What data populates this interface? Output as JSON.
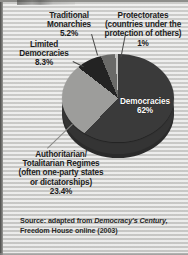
{
  "figure": {
    "background_color": "#d8d8d6",
    "source_prefix": "Source: adapted from ",
    "source_italic": "Democracy's Century,",
    "source_suffix": "Freedom House online (2003)"
  },
  "chart_data": {
    "type": "pie",
    "title": "",
    "xlabel": "",
    "ylabel": "",
    "legend_position": "callout-labels",
    "grid": false,
    "three_d": true,
    "categories": [
      "Democracies",
      "Authoritarian/Totalitarian Regimes",
      "Limited Democracies",
      "Traditional Monarchies",
      "Protectorates"
    ],
    "values": [
      62,
      23.4,
      8.3,
      5.2,
      1
    ],
    "value_labels": [
      "62%",
      "23.4%",
      "8.3%",
      "5.2%",
      "1%"
    ],
    "colors": [
      "#3a3a3a",
      "#9d9d9b",
      "#232323",
      "#6a6a68",
      "#c3c3c1"
    ],
    "slices": [
      {
        "name": "Democracies",
        "value": 62,
        "value_label": "62%",
        "color": "#3a3a3a",
        "label_placement": "inside",
        "label_line1": "Democracies",
        "label_line2": "62%"
      },
      {
        "name": "Authoritarian/Totalitarian Regimes",
        "value": 23.4,
        "value_label": "23.4%",
        "color": "#9d9d9b",
        "label_placement": "callout-bottom-left",
        "label_line1": "Authoritarian/",
        "label_line2": "Totalitarian Regimes",
        "label_line3": "(often one-party states",
        "label_line4": "or dictatorships)",
        "label_line5": "23.4%"
      },
      {
        "name": "Limited Democracies",
        "value": 8.3,
        "value_label": "8.3%",
        "color": "#232323",
        "label_placement": "callout-left",
        "label_line1": "Limited",
        "label_line2": "Democracies",
        "label_line3": "8.3%"
      },
      {
        "name": "Traditional Monarchies",
        "value": 5.2,
        "value_label": "5.2%",
        "color": "#6a6a68",
        "label_placement": "callout-top",
        "label_line1": "Traditional",
        "label_line2": "Monarchies",
        "label_line3": "5.2%"
      },
      {
        "name": "Protectorates",
        "value": 1,
        "value_label": "1%",
        "color": "#c3c3c1",
        "label_placement": "callout-top-right",
        "label_line1": "Protectorates",
        "label_line2": "(countries under the",
        "label_line3": "protection of others)",
        "label_line4": "1%"
      }
    ]
  }
}
